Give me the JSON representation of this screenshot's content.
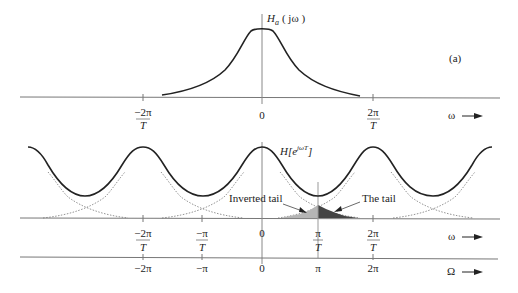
{
  "panel_a": {
    "label": "(a)",
    "curve_label_main": "H",
    "curve_label_sub": "a",
    "curve_label_arg": "( jω )",
    "x_axis_label": "ω",
    "ticks": [
      {
        "num": "−2π",
        "den": "T",
        "x": 143
      },
      {
        "num": "0",
        "den": "",
        "x": 262
      },
      {
        "num": "2π",
        "den": "T",
        "x": 373
      }
    ]
  },
  "panel_b": {
    "curve_label_main": "H[e",
    "curve_label_sup": "jωT",
    "curve_label_close": "]",
    "annotation_inverted": "Inverted tail",
    "annotation_tail": "The tail",
    "omega_axis_label": "ω",
    "Omega_axis_label": "Ω",
    "omega_ticks": [
      {
        "num": "−2π",
        "den": "T",
        "x": 143
      },
      {
        "num": "−π",
        "den": "T",
        "x": 202
      },
      {
        "num": "0",
        "den": "",
        "x": 262
      },
      {
        "num": "π",
        "den": "T",
        "x": 318
      },
      {
        "num": "2π",
        "den": "T",
        "x": 373
      }
    ],
    "Omega_ticks": [
      {
        "label": "−2π",
        "x": 143
      },
      {
        "label": "−π",
        "x": 202
      },
      {
        "label": "0",
        "x": 262
      },
      {
        "label": "π",
        "x": 318
      },
      {
        "label": "2π",
        "x": 373
      }
    ]
  },
  "colors": {
    "curve": "#222222",
    "axis": "#777777",
    "dotted": "#888888",
    "inverted_tail_fill": "#b5b5b5",
    "tail_fill": "#444444"
  }
}
